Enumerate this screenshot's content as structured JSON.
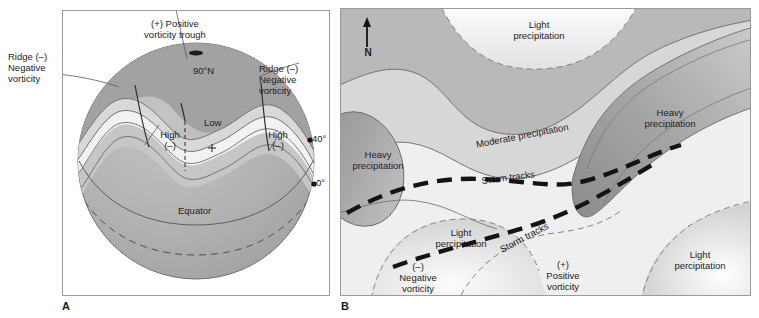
{
  "figure": {
    "panels": [
      {
        "letter": "A",
        "name": "globe-upper-air-wave-pattern",
        "labels": {
          "positive_vorticity_trough": "(+) Positive\nvorticity trough",
          "ridge_left": "Ridge (–)\nNegative\nvorticity",
          "ridge_right": "Ridge (–)\nNegative\nvorticity",
          "high_left": "High\n(–)",
          "high_right": "High\n(–)",
          "low": "Low",
          "low_marker": "+",
          "pole": "90°N",
          "lat40": "40° N",
          "lat0": "0°",
          "equator": "Equator"
        }
      },
      {
        "letter": "B",
        "name": "precipitation-storm-track-map",
        "labels": {
          "north_arrow": "N",
          "light_precip_top": "Light\nprecipitation",
          "light_precip_bottom_left": "Light\npercipitation",
          "light_precip_bottom_right": "Light\npercipitation",
          "heavy_precip_left": "Heavy\nprecipitation",
          "heavy_precip_right": "Heavy\nprecipitation",
          "moderate_precip": "Moderate precipitation",
          "storm_tracks_upper": "Storm tracks",
          "storm_tracks_lower": "Storm tracks",
          "negative_vorticity": "(–)\nNegative\nvorticity",
          "positive_vorticity": "(+)\nPositive\nvorticity"
        }
      }
    ]
  },
  "colors": {
    "background": "#ffffff",
    "panel_border": "#9a9a9a",
    "globe_base": "#b0b0b0",
    "globe_dark": "#9a9a9a",
    "band_light": "#f0f0f0",
    "band_mid": "#cfcfcf",
    "map_base": "#b9b9b9",
    "map_light": "#efefef",
    "map_white": "#fdfdfd",
    "map_dark": "#9d9d9d",
    "line": "#4a4a4a",
    "storm_track": "#141414",
    "text": "#1d1d1d"
  }
}
